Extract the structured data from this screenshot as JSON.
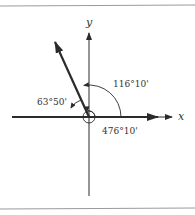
{
  "figure": {
    "axes": {
      "x_label": "x",
      "y_label": "y"
    },
    "angles": [
      {
        "name": "reference-angle",
        "label": "63°50'"
      },
      {
        "name": "standard-angle",
        "label": "116°10'"
      },
      {
        "name": "coterminal-angle",
        "label": "476°10'"
      }
    ],
    "colors": {
      "ink": "#2b2b2b",
      "rule": "#9a9a9a",
      "background": "#ffffff"
    }
  }
}
